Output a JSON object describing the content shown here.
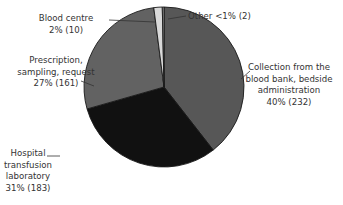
{
  "chart_data": {
    "type": "pie",
    "title": "",
    "start": "12 o'clock",
    "direction": "clockwise",
    "slices": [
      {
        "label": "Collection from the blood bank, bedside administration",
        "label_lines": [
          "Collection from the",
          "blood bank, bedside",
          "administration",
          "40% (232)"
        ],
        "percent_text": "40%",
        "count": 232,
        "color": "#575757"
      },
      {
        "label": "Hospital transfusion laboratory",
        "label_lines": [
          "Hospital",
          "transfusion",
          "laboratory",
          "31% (183)"
        ],
        "percent_text": "31%",
        "count": 183,
        "color": "#111111"
      },
      {
        "label": "Prescription, sampling, request",
        "label_lines": [
          "Prescription,",
          "sampling, request",
          "27% (161)"
        ],
        "percent_text": "27%",
        "count": 161,
        "color": "#626262"
      },
      {
        "label": "Blood centre",
        "label_lines": [
          "Blood centre",
          "2% (10)"
        ],
        "percent_text": "2%",
        "count": 10,
        "color": "#d9d9d9"
      },
      {
        "label": "Other",
        "label_lines": [
          "Other <1% (2)"
        ],
        "percent_text": "<1%",
        "count": 2,
        "color": "#a8a8a8"
      }
    ],
    "total": 588
  }
}
